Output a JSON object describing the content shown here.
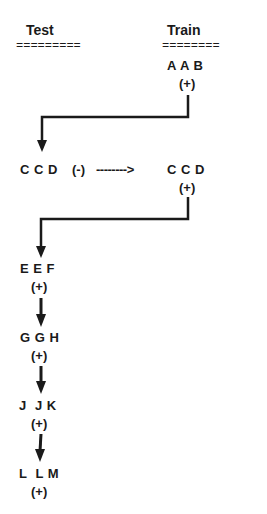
{
  "columns": {
    "test": {
      "label": "Test",
      "underline": "========="
    },
    "train": {
      "label": "Train",
      "underline": "========"
    }
  },
  "nodes": [
    {
      "id": "aab_train",
      "label": "A A B",
      "sign": "(+)",
      "column": "train"
    },
    {
      "id": "ccd_test",
      "label": "C C D",
      "sign": "(-)",
      "column": "test"
    },
    {
      "id": "ccd_train",
      "label": "C C D",
      "sign": "(+)",
      "column": "train"
    },
    {
      "id": "eef",
      "label": "E E F",
      "sign": "(+)",
      "column": "test"
    },
    {
      "id": "ggh",
      "label": "G G H",
      "sign": "(+)",
      "column": "test"
    },
    {
      "id": "jjk",
      "label": "J  J K",
      "sign": "(+)",
      "column": "test"
    },
    {
      "id": "llm",
      "label": "L  L M",
      "sign": "(+)",
      "column": "test"
    }
  ],
  "edges": [
    {
      "from": "aab_train",
      "to": "ccd_test",
      "style": "solid-elbow-arrow"
    },
    {
      "from": "ccd_test",
      "to": "ccd_train",
      "style": "dashed-arrow",
      "label": "-------->"
    },
    {
      "from": "ccd_train",
      "to": "eef",
      "style": "solid-elbow-arrow"
    },
    {
      "from": "eef",
      "to": "ggh",
      "style": "solid-arrow"
    },
    {
      "from": "ggh",
      "to": "jjk",
      "style": "solid-arrow"
    },
    {
      "from": "jjk",
      "to": "llm",
      "style": "solid-arrow"
    }
  ],
  "colors": {
    "ink": "#1a1a1a",
    "background": "#ffffff"
  }
}
